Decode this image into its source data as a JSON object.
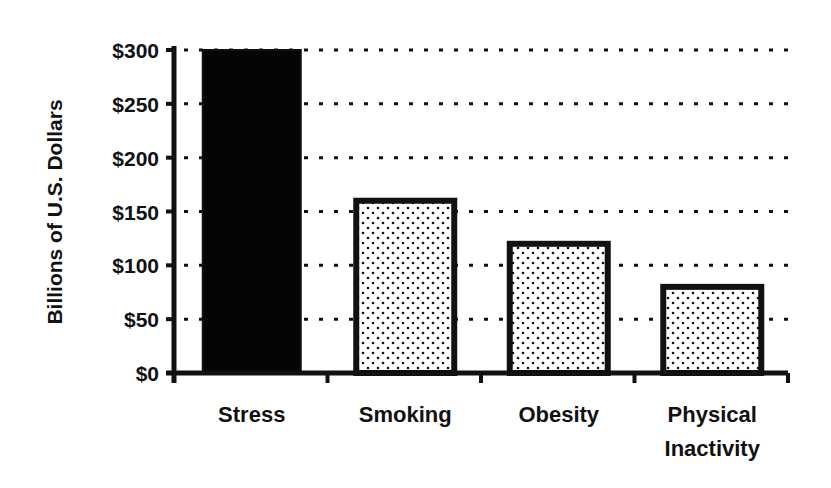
{
  "chart_data": {
    "type": "bar",
    "title": "",
    "xlabel": "",
    "ylabel": "Billions of U.S. Dollars",
    "categories": [
      "Stress",
      "Smoking",
      "Obesity",
      "Physical Inactivity"
    ],
    "category_lines": [
      [
        "Stress"
      ],
      [
        "Smoking"
      ],
      [
        "Obesity"
      ],
      [
        "Physical",
        "Inactivity"
      ]
    ],
    "values": [
      300,
      160,
      120,
      80
    ],
    "bar_styles": [
      "solid-black",
      "dotted",
      "dotted",
      "dotted"
    ],
    "ylim": [
      0,
      300
    ],
    "yticks": [
      0,
      50,
      100,
      150,
      200,
      250,
      300
    ],
    "ytick_labels": [
      "$0",
      "$50",
      "$100",
      "$150",
      "$200",
      "$250",
      "$300"
    ],
    "grid": "horizontal dotted",
    "legend": null,
    "colors": {
      "ink": "#111111",
      "background": "#ffffff",
      "stress_fill": "#050505"
    }
  }
}
